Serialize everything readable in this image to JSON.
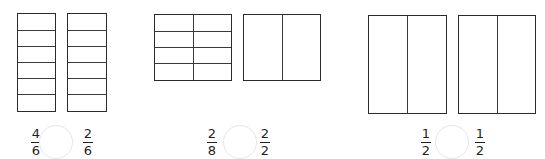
{
  "problems": [
    {
      "models": [
        {
          "cols": 1,
          "rows": 6,
          "x": 17,
          "y": 13,
          "w": 39,
          "h": 99
        },
        {
          "cols": 1,
          "rows": 6,
          "x": 67,
          "y": 13,
          "w": 40,
          "h": 99
        }
      ],
      "left": {
        "num": "4",
        "den": "6"
      },
      "right": {
        "num": "2",
        "den": "6"
      },
      "left_x": 30,
      "circle_cx": 56,
      "right_x": 82,
      "answer": ""
    },
    {
      "models": [
        {
          "cols": 2,
          "rows": 4,
          "x": 154,
          "y": 14,
          "w": 78,
          "h": 67
        },
        {
          "cols": 2,
          "rows": 1,
          "x": 243,
          "y": 14,
          "w": 78,
          "h": 67
        }
      ],
      "left": {
        "num": "2",
        "den": "8"
      },
      "right": {
        "num": "2",
        "den": "2"
      },
      "left_x": 206,
      "circle_cx": 240,
      "right_x": 259,
      "answer": ""
    },
    {
      "models": [
        {
          "cols": 2,
          "rows": 1,
          "x": 368,
          "y": 15,
          "w": 79,
          "h": 99
        },
        {
          "cols": 2,
          "rows": 1,
          "x": 458,
          "y": 15,
          "w": 78,
          "h": 99
        }
      ],
      "left": {
        "num": "1",
        "den": "2"
      },
      "right": {
        "num": "1",
        "den": "2"
      },
      "left_x": 420,
      "circle_cx": 452,
      "right_x": 474,
      "answer": ""
    }
  ],
  "circle_radius": 17,
  "fraction_y": 127,
  "circle_cy": 142
}
